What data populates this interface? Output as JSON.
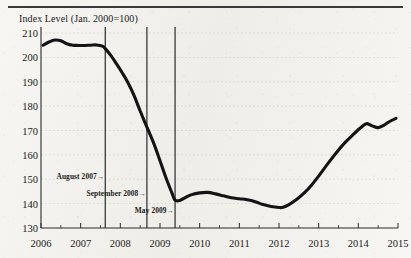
{
  "figure": {
    "title": "Index Level (Jan. 2000=100)"
  },
  "chart_data": {
    "type": "line",
    "title": "Index Level (Jan. 2000=100)",
    "xlabel": "",
    "ylabel": "Index Level (Jan. 2000=100)",
    "xlim": [
      2006,
      2015
    ],
    "ylim": [
      130,
      210
    ],
    "y_ticks": [
      130,
      140,
      150,
      160,
      170,
      180,
      190,
      200,
      210
    ],
    "x_ticks": [
      2006,
      2007,
      2008,
      2009,
      2010,
      2011,
      2012,
      2013,
      2014,
      2015
    ],
    "x_tick_labels": [
      "2006",
      "2007",
      "2008",
      "2009",
      "2010",
      "2011",
      "2012",
      "2013",
      "2014",
      "2015"
    ],
    "y_tick_labels": [
      "130",
      "140",
      "150",
      "160",
      "170",
      "180",
      "190",
      "200",
      "210"
    ],
    "grid": true,
    "legend": "none",
    "series": [
      {
        "name": "Index Level",
        "x": [
          2006.05,
          2006.2,
          2006.35,
          2006.5,
          2006.65,
          2006.8,
          2006.95,
          2007.1,
          2007.25,
          2007.4,
          2007.55,
          2007.62,
          2007.75,
          2007.9,
          2008.05,
          2008.2,
          2008.35,
          2008.5,
          2008.67,
          2008.85,
          2009.0,
          2009.15,
          2009.3,
          2009.38,
          2009.5,
          2009.65,
          2009.8,
          2010.0,
          2010.2,
          2010.4,
          2010.6,
          2010.8,
          2011.0,
          2011.2,
          2011.4,
          2011.6,
          2011.8,
          2012.0,
          2012.1,
          2012.25,
          2012.45,
          2012.65,
          2012.85,
          2013.05,
          2013.25,
          2013.45,
          2013.65,
          2013.85,
          2014.05,
          2014.2,
          2014.35,
          2014.5,
          2014.65,
          2014.8,
          2014.95
        ],
        "y": [
          205.0,
          206.3,
          207.1,
          206.8,
          205.6,
          205.0,
          204.9,
          204.9,
          205.0,
          205.1,
          204.6,
          203.6,
          201.0,
          197.4,
          193.6,
          189.4,
          184.2,
          178.0,
          171.4,
          164.4,
          157.6,
          150.6,
          144.4,
          141.4,
          141.3,
          142.6,
          143.7,
          144.4,
          144.6,
          144.0,
          143.2,
          142.4,
          142.0,
          141.6,
          140.8,
          139.6,
          138.8,
          138.4,
          138.5,
          139.6,
          141.8,
          144.6,
          148.2,
          152.4,
          156.8,
          161.0,
          164.8,
          168.0,
          171.0,
          172.8,
          171.9,
          171.2,
          172.2,
          173.8,
          175.0
        ]
      }
    ],
    "annotations": [
      {
        "label": "August 2007",
        "x": 2007.62,
        "type": "vline-with-arrow-label"
      },
      {
        "label": "September 2008",
        "x": 2008.67,
        "type": "vline-with-arrow-label"
      },
      {
        "label": "May 2009",
        "x": 2009.38,
        "type": "vline-with-arrow-label"
      }
    ]
  },
  "annotations": {
    "august_2007": "August 2007",
    "september_2008": "September 2008",
    "may_2009": "May 2009",
    "arrow_glyph": "→"
  },
  "colors": {
    "line": "#141414",
    "axis": "#2b2b2b",
    "grid": "#c9c5bb",
    "background": "#f7f6f3",
    "text": "#1a1a1a"
  }
}
